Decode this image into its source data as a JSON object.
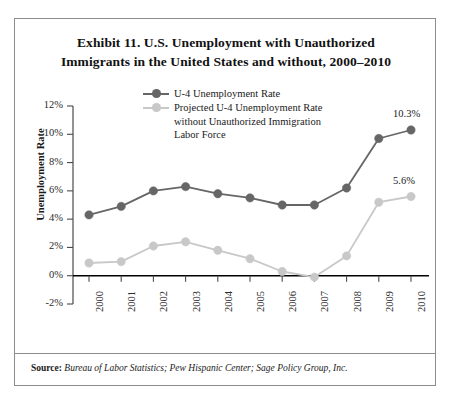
{
  "figure": {
    "title_line1": "Exhibit 11. U.S. Unemployment with Unauthorized",
    "title_line2": "Immigrants in the United States and without, 2000–2010",
    "source_label": "Source:",
    "source_text": " Bureau of Labor Statistics; Pew Hispanic Center; Sage Policy Group, Inc.",
    "colors": {
      "series_dark": "#666666",
      "series_light": "#c8c8c8",
      "axis": "#000000",
      "frame": "#8d8d8d",
      "text": "#1a1a1a"
    }
  },
  "chart_data": {
    "type": "line",
    "title": "Exhibit 11. U.S. Unemployment with Unauthorized Immigrants in the United States and without, 2000–2010",
    "xlabel": "",
    "ylabel": "Unemployment Rate",
    "categories": [
      "2000",
      "2001",
      "2002",
      "2003",
      "2004",
      "2005",
      "2006",
      "2007",
      "2008",
      "2009",
      "2010"
    ],
    "ylim": [
      -2,
      12
    ],
    "yticks": [
      -2,
      0,
      2,
      4,
      6,
      8,
      10,
      12
    ],
    "ytick_labels": [
      "-2%",
      "0%",
      "2%",
      "4%",
      "6%",
      "8%",
      "10%",
      "12%"
    ],
    "grid": false,
    "legend_position": "top-center",
    "series": [
      {
        "name": "U-4 Unemployment Rate",
        "color": "#666666",
        "values": [
          4.3,
          4.9,
          6.0,
          6.3,
          5.8,
          5.5,
          5.0,
          5.0,
          6.2,
          9.7,
          10.3
        ]
      },
      {
        "name": "Projected U-4 Unemployment Rate without Unauthorized Immigration Labor Force",
        "color": "#c8c8c8",
        "values": [
          0.9,
          1.0,
          2.1,
          2.4,
          1.8,
          1.2,
          0.3,
          -0.1,
          1.4,
          5.2,
          5.6
        ]
      }
    ],
    "annotations": [
      {
        "text": "10.3%",
        "series": "U-4 Unemployment Rate",
        "x": "2010",
        "y": 10.3
      },
      {
        "text": "5.6%",
        "series": "Projected U-4 Unemployment Rate without Unauthorized Immigration Labor Force",
        "x": "2010",
        "y": 5.6
      }
    ]
  },
  "legend": {
    "entries": [
      {
        "label": "U-4 Unemployment Rate",
        "sublines": []
      },
      {
        "label": "Projected U-4 Unemployment Rate",
        "sublines": [
          "without Unauthorized Immigration",
          "Labor Force"
        ]
      }
    ]
  }
}
